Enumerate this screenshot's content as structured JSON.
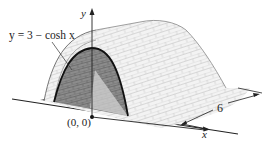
{
  "figure": {
    "equation_label": "y = 3 − cosh x",
    "y_axis_label": "y",
    "x_axis_label": "x",
    "origin_label": "(0, 0)",
    "length_dimension": "6",
    "colors": {
      "line": "#222222",
      "front_face": "#8a8a8a",
      "brick_surface": "#f2f2f2",
      "brick_lines": "#bcbcbc",
      "shadow": "#dcdcdc"
    }
  }
}
